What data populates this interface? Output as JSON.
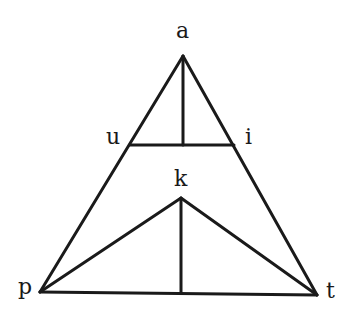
{
  "diagram": {
    "type": "vowel-consonant triangle",
    "stroke_color": "#1a1a1a",
    "background": "#ffffff",
    "labels": {
      "a": "a",
      "u": "u",
      "i": "i",
      "k": "k",
      "p": "p",
      "t": "t"
    },
    "vertices": {
      "a": [
        183,
        56
      ],
      "u": [
        130,
        145
      ],
      "i": [
        234,
        145
      ],
      "k": [
        181,
        198
      ],
      "p": [
        40,
        292
      ],
      "t": [
        317,
        295
      ]
    },
    "edges": [
      [
        "a",
        "p"
      ],
      [
        "a",
        "t"
      ],
      [
        "p",
        "t"
      ],
      [
        "u",
        "i"
      ],
      [
        "a",
        "ui-mid"
      ],
      [
        "p",
        "k"
      ],
      [
        "k",
        "t"
      ],
      [
        "k",
        "pt-mid"
      ]
    ]
  }
}
